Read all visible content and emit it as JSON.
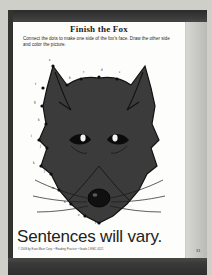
{
  "worksheet": {
    "title": "Finish the Fox",
    "instructions": "Connect the dots to make one side of the fox's face. Draw the other side and color the picture.",
    "answer_overlay": "Sentences will vary.",
    "copyright": "© 2009 by Evan-Moor Corp. • Reading Practice • Grade 1 EMC 4521",
    "page_number": "31"
  },
  "art": {
    "subject": "fox-head-silhouette",
    "fill_color": "#3b3b3b",
    "outline_color": "#111111",
    "dot_labels": [
      "a",
      "b",
      "c",
      "d",
      "e",
      "f",
      "g",
      "h",
      "i",
      "j",
      "k",
      "l",
      "m",
      "n",
      "o",
      "p",
      "q",
      "r",
      "s",
      "t",
      "u",
      "v",
      "w",
      "x"
    ]
  },
  "scan": {
    "paper_color": "#fdfdfb",
    "band_color": "#2e2e2e",
    "gutter_color": "#c6c6c2"
  }
}
